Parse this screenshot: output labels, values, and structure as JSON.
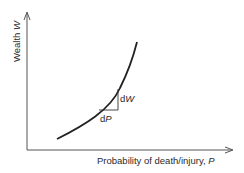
{
  "diagram": {
    "y_axis": {
      "label": "Wealth",
      "symbol": "W"
    },
    "x_axis": {
      "label": "Probability of death/injury,",
      "symbol": "P"
    },
    "curve": {
      "description": "convex increasing curve of wealth vs. probability of death/injury"
    },
    "slope_triangle": {
      "vertical_label": "d",
      "vertical_symbol": "W",
      "horizontal_label": "d",
      "horizontal_symbol": "P"
    },
    "colors": {
      "axis": "#555555",
      "curve": "#222222",
      "text": "#2a2a2a"
    }
  }
}
